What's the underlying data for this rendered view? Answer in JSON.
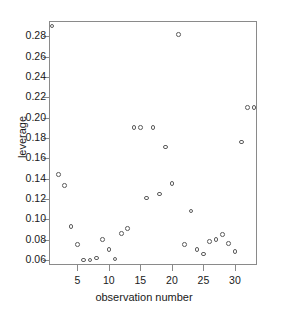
{
  "chart_data": {
    "type": "scatter",
    "title": "",
    "xlabel": "observation number",
    "ylabel": "leverage",
    "xlim": [
      0.5,
      33.5
    ],
    "ylim": [
      0.055,
      0.295
    ],
    "grid": false,
    "legend": null,
    "marker": "open-circle",
    "marker_color": "#5c5c5c",
    "xticks": [
      5,
      10,
      15,
      20,
      25,
      30
    ],
    "xtick_labels": [
      "5",
      "10",
      "15",
      "20",
      "25",
      "30"
    ],
    "yticks": [
      0.06,
      0.08,
      0.1,
      0.12,
      0.14,
      0.16,
      0.18,
      0.2,
      0.22,
      0.24,
      0.26,
      0.28
    ],
    "ytick_labels": [
      "0.06",
      "0.08",
      "0.10",
      "0.12",
      "0.14",
      "0.16",
      "0.18",
      "0.20",
      "0.22",
      "0.24",
      "0.26",
      "0.28"
    ],
    "x": [
      1,
      2,
      3,
      4,
      5,
      6,
      7,
      8,
      9,
      10,
      11,
      12,
      13,
      14,
      15,
      16,
      17,
      18,
      19,
      20,
      21,
      22,
      23,
      24,
      25,
      26,
      27,
      28,
      29,
      30,
      31,
      32,
      33
    ],
    "y": [
      0.29,
      0.144,
      0.133,
      0.093,
      0.075,
      0.06,
      0.06,
      0.062,
      0.08,
      0.07,
      0.061,
      0.086,
      0.091,
      0.19,
      0.19,
      0.121,
      0.19,
      0.125,
      0.171,
      0.135,
      0.282,
      0.075,
      0.108,
      0.07,
      0.066,
      0.078,
      0.08,
      0.085,
      0.076,
      0.068,
      0.176,
      0.21,
      0.21
    ],
    "points": [
      {
        "obs": 1,
        "leverage": 0.29
      },
      {
        "obs": 2,
        "leverage": 0.144
      },
      {
        "obs": 3,
        "leverage": 0.133
      },
      {
        "obs": 4,
        "leverage": 0.093
      },
      {
        "obs": 5,
        "leverage": 0.075
      },
      {
        "obs": 6,
        "leverage": 0.06
      },
      {
        "obs": 7,
        "leverage": 0.06
      },
      {
        "obs": 8,
        "leverage": 0.062
      },
      {
        "obs": 9,
        "leverage": 0.08
      },
      {
        "obs": 10,
        "leverage": 0.07
      },
      {
        "obs": 11,
        "leverage": 0.061
      },
      {
        "obs": 12,
        "leverage": 0.086
      },
      {
        "obs": 13,
        "leverage": 0.091
      },
      {
        "obs": 14,
        "leverage": 0.19
      },
      {
        "obs": 15,
        "leverage": 0.19
      },
      {
        "obs": 16,
        "leverage": 0.121
      },
      {
        "obs": 17,
        "leverage": 0.19
      },
      {
        "obs": 18,
        "leverage": 0.125
      },
      {
        "obs": 19,
        "leverage": 0.171
      },
      {
        "obs": 20,
        "leverage": 0.135
      },
      {
        "obs": 21,
        "leverage": 0.282
      },
      {
        "obs": 22,
        "leverage": 0.075
      },
      {
        "obs": 23,
        "leverage": 0.108
      },
      {
        "obs": 24,
        "leverage": 0.07
      },
      {
        "obs": 25,
        "leverage": 0.066
      },
      {
        "obs": 26,
        "leverage": 0.078
      },
      {
        "obs": 27,
        "leverage": 0.08
      },
      {
        "obs": 28,
        "leverage": 0.085
      },
      {
        "obs": 29,
        "leverage": 0.076
      },
      {
        "obs": 30,
        "leverage": 0.068
      },
      {
        "obs": 31,
        "leverage": 0.176
      },
      {
        "obs": 32,
        "leverage": 0.21
      },
      {
        "obs": 33,
        "leverage": 0.21
      }
    ]
  }
}
